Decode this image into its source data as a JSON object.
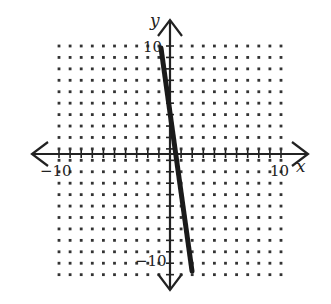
{
  "chart_data": {
    "type": "line",
    "title": "",
    "xlabel": "x",
    "ylabel": "y",
    "xlim": [
      -10,
      10
    ],
    "ylim": [
      -10,
      10
    ],
    "grid": "dotted lattice, 1 unit spacing",
    "tick_labels": {
      "x": [
        "-10",
        "10"
      ],
      "y": [
        "10",
        "-10"
      ]
    },
    "series": [
      {
        "name": "line",
        "points": [
          [
            -1,
            9
          ],
          [
            1.4,
            -10
          ]
        ],
        "slope_approx": -8,
        "x_intercept_approx": 0.6
      }
    ]
  },
  "labels": {
    "x_axis": "x",
    "y_axis": "y",
    "x_min": "-10",
    "x_max": "10",
    "y_max": "10",
    "y_min": "-10"
  },
  "colors": {
    "ink": "#222222",
    "dots": "#333333",
    "background": "#ffffff"
  }
}
